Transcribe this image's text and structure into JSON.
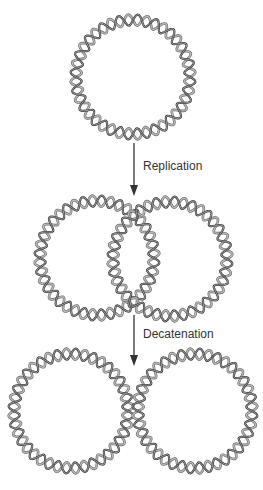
{
  "diagram": {
    "colors": {
      "background": "#ffffff",
      "strand_dark": "#3a3a3a",
      "strand_light": "#b8b8b8",
      "arrow": "#333333",
      "label": "#333333"
    },
    "helix": {
      "radius": 57,
      "amplitude": 5.5,
      "turns": 20
    },
    "stages": [
      {
        "name": "parental-circle",
        "circles": [
          {
            "cx": 133,
            "cy": 77
          }
        ]
      },
      {
        "name": "catenated-daughter-circles",
        "circles": [
          {
            "cx": 97,
            "cy": 258
          },
          {
            "cx": 170,
            "cy": 259
          }
        ]
      },
      {
        "name": "separated-daughter-circles",
        "circles": [
          {
            "cx": 71,
            "cy": 411
          },
          {
            "cx": 195,
            "cy": 411
          }
        ]
      }
    ],
    "steps": [
      {
        "label": "Replication",
        "arrow": {
          "x": 134,
          "y1": 143,
          "y2": 196
        },
        "label_pos": {
          "x": 143,
          "y": 159
        }
      },
      {
        "label": "Decatenation",
        "arrow": {
          "x": 134,
          "y1": 315,
          "y2": 366
        },
        "label_pos": {
          "x": 143,
          "y": 327
        }
      }
    ]
  }
}
